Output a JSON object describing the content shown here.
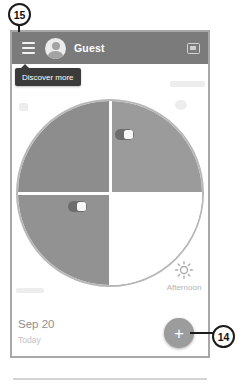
{
  "annotations": {
    "callout_15": "15",
    "callout_14": "14"
  },
  "header": {
    "user_name": "Guest"
  },
  "tooltip": {
    "text": "Discover more"
  },
  "wheel": {
    "selected_period_label": "Afternoon",
    "selected_period_icon": "sun-icon",
    "switches": [
      {
        "quadrant": "top-right",
        "state": "on"
      },
      {
        "quadrant": "bottom-left",
        "state": "on"
      }
    ]
  },
  "footer": {
    "date": "Sep 20",
    "subtext": "Today",
    "fab_label": "+"
  },
  "colors": {
    "header_bg": "#7b7b7b",
    "tooltip_bg": "#3b3b3b",
    "quadrant_top_left": "#8d8d8d",
    "quadrant_top_right": "#9b9b9b",
    "quadrant_bottom_left": "#929292",
    "quadrant_selected": "#ffffff",
    "wheel_rim": "#b8b8b8",
    "fab_bg": "#9c9c9c",
    "callout_stroke": "#1c1c1c"
  }
}
